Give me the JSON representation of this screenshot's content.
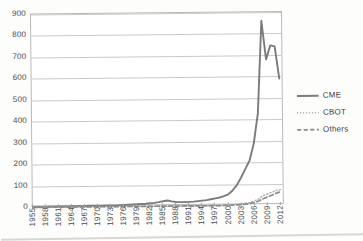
{
  "chart_data": {
    "type": "line",
    "title": "",
    "xlabel": "",
    "ylabel": "",
    "ylim": [
      0,
      900
    ],
    "ytick_labels": [
      "900",
      "800",
      "700",
      "600",
      "500",
      "400",
      "300",
      "200",
      "100",
      "0"
    ],
    "ytick_values": [
      900,
      800,
      700,
      600,
      500,
      400,
      300,
      200,
      100,
      0
    ],
    "grid": true,
    "legend_position": "right",
    "xlim": [
      1955,
      2013
    ],
    "x_tick_step": 3,
    "xtick_labels": [
      "1955",
      "1958",
      "1961",
      "1964",
      "1967",
      "1970",
      "1973",
      "1976",
      "1979",
      "1982",
      "1985",
      "1988",
      "1991",
      "1994",
      "1997",
      "2000",
      "2003",
      "2006",
      "2009",
      "2012"
    ],
    "x": [
      1955,
      1956,
      1957,
      1958,
      1959,
      1960,
      1961,
      1962,
      1963,
      1964,
      1965,
      1966,
      1967,
      1968,
      1969,
      1970,
      1971,
      1972,
      1973,
      1974,
      1975,
      1976,
      1977,
      1978,
      1979,
      1980,
      1981,
      1982,
      1983,
      1984,
      1985,
      1986,
      1987,
      1988,
      1989,
      1990,
      1991,
      1992,
      1993,
      1994,
      1995,
      1996,
      1997,
      1998,
      1999,
      2000,
      2001,
      2002,
      2003,
      2004,
      2005,
      2006,
      2007,
      2008,
      2009,
      2010,
      2011,
      2012
    ],
    "series": [
      {
        "name": "CME",
        "style": "solid",
        "color": "#7b7b7b",
        "values": [
          2,
          2,
          2,
          2,
          3,
          3,
          3,
          3,
          3,
          4,
          4,
          4,
          4,
          5,
          5,
          5,
          5,
          6,
          6,
          6,
          7,
          7,
          8,
          9,
          10,
          11,
          12,
          14,
          16,
          19,
          23,
          26,
          22,
          19,
          18,
          18,
          19,
          20,
          22,
          24,
          26,
          30,
          34,
          38,
          44,
          52,
          70,
          95,
          130,
          170,
          210,
          290,
          430,
          860,
          680,
          745,
          740,
          590
        ]
      },
      {
        "name": "CBOT",
        "style": "dotted",
        "color": "#b4b4b4",
        "values": [
          0,
          0,
          0,
          0,
          0,
          0,
          0,
          0,
          0,
          0,
          0,
          0,
          0,
          0,
          0,
          0,
          0,
          0,
          0,
          0,
          0,
          0,
          0,
          0,
          0,
          0,
          0,
          0,
          0,
          0,
          0,
          0,
          0,
          0,
          0,
          0,
          0,
          0,
          0,
          0,
          0,
          0,
          1,
          1,
          2,
          3,
          4,
          5,
          7,
          10,
          14,
          20,
          30,
          45,
          52,
          60,
          68,
          72
        ]
      },
      {
        "name": "Others",
        "style": "dashed",
        "color": "#8a8a8a",
        "values": [
          0,
          0,
          0,
          0,
          0,
          0,
          0,
          0,
          0,
          0,
          0,
          0,
          0,
          0,
          0,
          0,
          0,
          0,
          0,
          0,
          0,
          0,
          0,
          0,
          0,
          0,
          0,
          0,
          0,
          0,
          0,
          0,
          0,
          0,
          0,
          0,
          0,
          0,
          0,
          0,
          0,
          0,
          0,
          0,
          1,
          1,
          2,
          3,
          4,
          6,
          9,
          13,
          20,
          30,
          38,
          46,
          55,
          62
        ]
      }
    ]
  },
  "legend": {
    "items": [
      {
        "label": "CME"
      },
      {
        "label": "CBOT"
      },
      {
        "label": "Others"
      }
    ]
  }
}
